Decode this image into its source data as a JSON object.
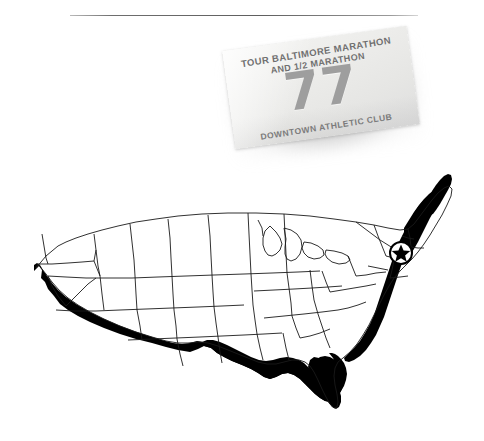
{
  "page": {
    "background_color": "#ffffff",
    "rule_color": "#5f5f5f"
  },
  "bib": {
    "title_line1": "TOUR BALTIMORE MARATHON",
    "title_line2": "AND 1/2 MARATHON",
    "number": "77",
    "footer": "DOWNTOWN ATHLETIC CLUB",
    "number_color": "#9e9e9e",
    "text_color": "#6f6f6f",
    "card_color": "#ededeb"
  },
  "map": {
    "title": "United States outline map",
    "outline_color": "#1a1a1a",
    "fill_color": "#ffffff",
    "coast_shadow_color": "#000000",
    "marker": {
      "label": "Baltimore",
      "icon": "circled-star-marker",
      "x": 393,
      "y": 95
    }
  }
}
